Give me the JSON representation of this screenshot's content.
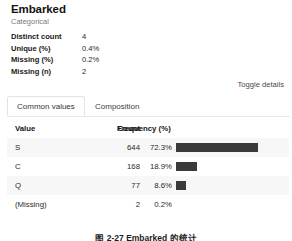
{
  "variable": {
    "name": "Embarked",
    "type": "Categorical"
  },
  "stats": [
    {
      "label": "Distinct count",
      "value": "4"
    },
    {
      "label": "Unique (%)",
      "value": "0.4%"
    },
    {
      "label": "Missing (%)",
      "value": "0.2%"
    },
    {
      "label": "Missing (n)",
      "value": "2"
    }
  ],
  "toggle_details_label": "Toggle details",
  "tabs": [
    {
      "label": "Common values",
      "active": true
    },
    {
      "label": "Composition",
      "active": false
    }
  ],
  "table": {
    "columns": [
      "Value",
      "Count",
      "Frequency (%)"
    ],
    "rows": [
      {
        "value": "S",
        "count": "644",
        "frequency": "72.3%",
        "bar_pct": 72.3,
        "has_bar": true
      },
      {
        "value": "C",
        "count": "168",
        "frequency": "18.9%",
        "bar_pct": 18.9,
        "has_bar": true
      },
      {
        "value": "Q",
        "count": "77",
        "frequency": "8.6%",
        "bar_pct": 8.6,
        "has_bar": true
      },
      {
        "value": "(Missing)",
        "count": "2",
        "frequency": "0.2%",
        "bar_pct": 0.2,
        "has_bar": false
      }
    ]
  },
  "figure_caption": "图 2-27  Embarked 的统计",
  "colors": {
    "bar_fill": "#3a3a3a",
    "row_stripe": "#f7f7f7",
    "panel_background": "#ffffff",
    "muted_text": "#7a7a7a",
    "divider": "#e8e8e8"
  }
}
